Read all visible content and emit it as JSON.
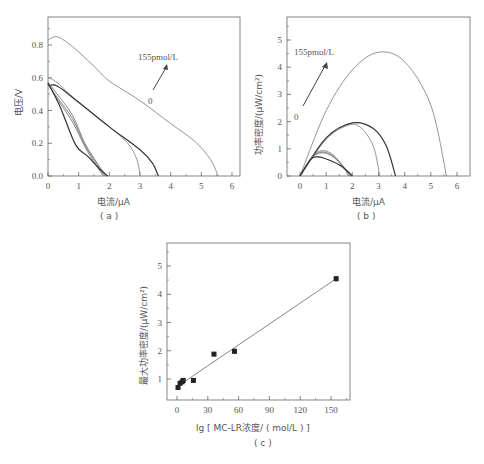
{
  "chart_data": [
    {
      "panel": "a",
      "type": "line",
      "caption": "( a )",
      "xlabel": "电流/μA",
      "ylabel": "电压/V",
      "xlim": [
        0,
        6.4
      ],
      "ylim": [
        0,
        0.9
      ],
      "xticks": [
        "0",
        "1",
        "2",
        "3",
        "4",
        "5",
        "6"
      ],
      "yticks": [
        "0.0",
        "0.2",
        "0.4",
        "0.6",
        "0.8"
      ],
      "annotations": [
        "155pmol/L",
        "0"
      ],
      "series": [
        {
          "name": "155pmol/L",
          "color": "#888888",
          "points": [
            [
              0,
              0.83
            ],
            [
              0.3,
              0.85
            ],
            [
              0.8,
              0.79
            ],
            [
              1.5,
              0.67
            ],
            [
              2,
              0.58
            ],
            [
              3,
              0.46
            ],
            [
              4,
              0.32
            ],
            [
              4.8,
              0.21
            ],
            [
              5.3,
              0.1
            ],
            [
              5.55,
              0
            ]
          ]
        },
        {
          "name": "curve-2",
          "color": "#888888",
          "points": [
            [
              0,
              0.6
            ],
            [
              0.3,
              0.57
            ],
            [
              1,
              0.45
            ],
            [
              2,
              0.3
            ],
            [
              2.6,
              0.2
            ],
            [
              2.9,
              0.1
            ],
            [
              3.0,
              0
            ]
          ]
        },
        {
          "name": "curve-3",
          "color": "#333333",
          "points": [
            [
              0,
              0.55
            ],
            [
              0.3,
              0.55
            ],
            [
              1,
              0.45
            ],
            [
              2,
              0.3
            ],
            [
              3,
              0.16
            ],
            [
              3.4,
              0.08
            ],
            [
              3.6,
              0
            ]
          ]
        },
        {
          "name": "curve-4",
          "color": "#777777",
          "points": [
            [
              0,
              0.57
            ],
            [
              0.3,
              0.5
            ],
            [
              0.8,
              0.37
            ],
            [
              1.2,
              0.2
            ],
            [
              1.6,
              0.08
            ],
            [
              1.9,
              0
            ]
          ]
        },
        {
          "name": "curve-5",
          "color": "#777777",
          "points": [
            [
              0,
              0.56
            ],
            [
              0.3,
              0.48
            ],
            [
              0.8,
              0.35
            ],
            [
              1.2,
              0.19
            ],
            [
              1.6,
              0.07
            ],
            [
              1.85,
              0
            ]
          ]
        },
        {
          "name": "curve-6",
          "color": "#777777",
          "points": [
            [
              0,
              0.56
            ],
            [
              0.3,
              0.47
            ],
            [
              0.8,
              0.33
            ],
            [
              1.2,
              0.18
            ],
            [
              1.55,
              0.07
            ],
            [
              1.8,
              0
            ]
          ]
        },
        {
          "name": "0",
          "color": "#333333",
          "points": [
            [
              0,
              0.57
            ],
            [
              0.4,
              0.42
            ],
            [
              0.9,
              0.19
            ],
            [
              1.3,
              0.12
            ],
            [
              1.7,
              0.04
            ],
            [
              1.95,
              0
            ]
          ]
        }
      ]
    },
    {
      "panel": "b",
      "type": "line",
      "caption": "( b )",
      "xlabel": "电流/μA",
      "ylabel": "功率密度/(μW/cm²)",
      "xlim": [
        -0.4,
        6.6
      ],
      "ylim": [
        0,
        5.8
      ],
      "xticks": [
        "0",
        "1",
        "2",
        "3",
        "4",
        "5",
        "6"
      ],
      "yticks": [
        "0",
        "1",
        "2",
        "3",
        "4",
        "5"
      ],
      "annotations": [
        "155pmol/L",
        "0"
      ],
      "series": [
        {
          "name": "155pmol/L",
          "color": "#888888",
          "points": [
            [
              0,
              0
            ],
            [
              1,
              2.4
            ],
            [
              2,
              3.9
            ],
            [
              3,
              4.55
            ],
            [
              4,
              4.2
            ],
            [
              5,
              2.6
            ],
            [
              5.6,
              0
            ]
          ]
        },
        {
          "name": "curve-2",
          "color": "#888888",
          "points": [
            [
              0,
              0
            ],
            [
              1,
              1.35
            ],
            [
              1.8,
              1.85
            ],
            [
              2.3,
              1.8
            ],
            [
              2.8,
              1.1
            ],
            [
              3.05,
              0
            ]
          ]
        },
        {
          "name": "curve-3",
          "color": "#333333",
          "points": [
            [
              0,
              0
            ],
            [
              1,
              1.4
            ],
            [
              2,
              1.95
            ],
            [
              2.8,
              1.75
            ],
            [
              3.3,
              1.1
            ],
            [
              3.65,
              0
            ]
          ]
        },
        {
          "name": "curve-4",
          "color": "#777777",
          "points": [
            [
              0,
              0
            ],
            [
              0.5,
              0.75
            ],
            [
              0.9,
              0.93
            ],
            [
              1.3,
              0.75
            ],
            [
              1.7,
              0.3
            ],
            [
              1.95,
              0
            ]
          ]
        },
        {
          "name": "curve-5",
          "color": "#777777",
          "points": [
            [
              0,
              0
            ],
            [
              0.5,
              0.72
            ],
            [
              0.9,
              0.88
            ],
            [
              1.3,
              0.7
            ],
            [
              1.7,
              0.28
            ],
            [
              1.9,
              0
            ]
          ]
        },
        {
          "name": "curve-6",
          "color": "#777777",
          "points": [
            [
              0,
              0
            ],
            [
              0.5,
              0.7
            ],
            [
              0.9,
              0.85
            ],
            [
              1.3,
              0.68
            ],
            [
              1.7,
              0.26
            ],
            [
              1.85,
              0
            ]
          ]
        },
        {
          "name": "0",
          "color": "#333333",
          "points": [
            [
              0,
              0
            ],
            [
              0.4,
              0.6
            ],
            [
              0.7,
              0.7
            ],
            [
              1.2,
              0.55
            ],
            [
              1.6,
              0.35
            ],
            [
              1.9,
              0.1
            ],
            [
              2.0,
              0
            ]
          ]
        }
      ]
    },
    {
      "panel": "c",
      "type": "scatter",
      "caption": "( c )",
      "xlabel": "lg [ MC-LR浓度/ ( mol/L ) ]",
      "ylabel": "最大功率密度/(μW/cm²)",
      "xlim": [
        -10,
        168
      ],
      "ylim": [
        0.25,
        5.8
      ],
      "xticks": [
        "0",
        "30",
        "60",
        "90",
        "120",
        "150"
      ],
      "yticks": [
        "1",
        "2",
        "3",
        "4",
        "5"
      ],
      "x": [
        1,
        3,
        5,
        6,
        16,
        36,
        56,
        155
      ],
      "y": [
        0.7,
        0.85,
        0.9,
        0.95,
        0.95,
        1.88,
        1.98,
        4.55
      ],
      "error": [
        0.08,
        0.08,
        0.08,
        0.08,
        0.08,
        0.08,
        0.1,
        0.1
      ],
      "fit_line": {
        "x": [
          5,
          155
        ],
        "y": [
          0.85,
          4.55
        ]
      }
    }
  ]
}
